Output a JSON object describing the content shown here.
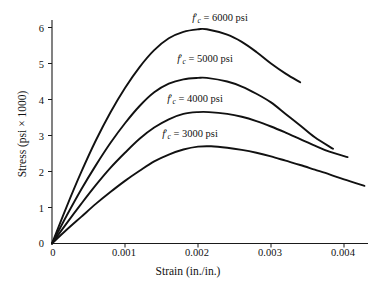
{
  "chart_data": {
    "type": "line",
    "title": "",
    "xlabel": "Strain (in./in.)",
    "ylabel": "Stress (psi × 1000)",
    "xlim": [
      0,
      0.00442
    ],
    "ylim": [
      0,
      6.35
    ],
    "grid": false,
    "legend_position": "inline-on-curves",
    "xticks": [
      "0",
      "0.001",
      "0.002",
      "0.003",
      "0.004"
    ],
    "xtick_values": [
      0,
      0.001,
      0.002,
      0.003,
      0.004
    ],
    "yticks": [
      "0",
      "1",
      "2",
      "3",
      "4",
      "5",
      "6"
    ],
    "ytick_values": [
      0,
      1,
      2,
      3,
      4,
      5,
      6
    ],
    "series": [
      {
        "name": "f'c = 6000 psi",
        "label_parts": {
          "f": "f",
          "prime": "′",
          "sub": "c",
          "rest": " = 6000 psi"
        },
        "peak_strain": 0.00212,
        "peak_stress": 5.95,
        "end_strain": 0.0034,
        "end_stress": 4.48,
        "x": [
          0,
          0.0002,
          0.0004,
          0.0006,
          0.0008,
          0.001,
          0.0012,
          0.0014,
          0.0016,
          0.0018,
          0.002,
          0.00212,
          0.0024,
          0.0026,
          0.0028,
          0.003,
          0.0032,
          0.0034
        ],
        "y": [
          0,
          1.02,
          1.98,
          2.86,
          3.64,
          4.32,
          4.9,
          5.37,
          5.7,
          5.88,
          5.95,
          5.95,
          5.8,
          5.6,
          5.32,
          5.0,
          4.72,
          4.48
        ]
      },
      {
        "name": "f'c = 5000 psi",
        "label_parts": {
          "f": "f",
          "prime": "′",
          "sub": "c",
          "rest": " = 5000 psi"
        },
        "peak_strain": 0.00212,
        "peak_stress": 4.6,
        "end_strain": 0.00385,
        "end_stress": 2.63,
        "x": [
          0,
          0.0002,
          0.0004,
          0.0006,
          0.0008,
          0.001,
          0.0012,
          0.0014,
          0.0016,
          0.0018,
          0.002,
          0.00212,
          0.0024,
          0.0026,
          0.0028,
          0.003,
          0.0032,
          0.0034,
          0.0036,
          0.00385
        ],
        "y": [
          0,
          0.77,
          1.5,
          2.17,
          2.79,
          3.34,
          3.82,
          4.2,
          4.44,
          4.56,
          4.6,
          4.6,
          4.5,
          4.36,
          4.16,
          3.92,
          3.6,
          3.28,
          2.95,
          2.63
        ]
      },
      {
        "name": "f'c = 4000 psi",
        "label_parts": {
          "f": "f",
          "prime": "′",
          "sub": "c",
          "rest": " = 4000 psi"
        },
        "peak_strain": 0.00215,
        "peak_stress": 3.65,
        "end_strain": 0.00405,
        "end_stress": 2.4,
        "x": [
          0,
          0.0002,
          0.0004,
          0.0006,
          0.0008,
          0.001,
          0.0012,
          0.0014,
          0.0016,
          0.0018,
          0.002,
          0.00215,
          0.0024,
          0.0026,
          0.0028,
          0.003,
          0.0032,
          0.0034,
          0.0036,
          0.0038,
          0.00405
        ],
        "y": [
          0,
          0.56,
          1.1,
          1.62,
          2.1,
          2.52,
          2.91,
          3.22,
          3.45,
          3.6,
          3.65,
          3.65,
          3.6,
          3.52,
          3.4,
          3.25,
          3.08,
          2.9,
          2.72,
          2.55,
          2.4
        ]
      },
      {
        "name": "f'c = 3000 psi",
        "label_parts": {
          "f": "f",
          "prime": "′",
          "sub": "c",
          "rest": " = 3000 psi"
        },
        "peak_strain": 0.00218,
        "peak_stress": 2.7,
        "end_strain": 0.00428,
        "end_stress": 1.6,
        "x": [
          0,
          0.0002,
          0.0004,
          0.0006,
          0.0008,
          0.001,
          0.0012,
          0.0014,
          0.0016,
          0.0018,
          0.002,
          0.00218,
          0.0024,
          0.0026,
          0.0028,
          0.003,
          0.0032,
          0.0034,
          0.0036,
          0.0038,
          0.004,
          0.00428
        ],
        "y": [
          0,
          0.38,
          0.74,
          1.1,
          1.43,
          1.74,
          2.02,
          2.28,
          2.47,
          2.61,
          2.69,
          2.7,
          2.66,
          2.6,
          2.52,
          2.42,
          2.3,
          2.18,
          2.05,
          1.92,
          1.78,
          1.6
        ]
      }
    ]
  },
  "labels": {
    "s6000": {
      "f": "f",
      "prime": "′",
      "sub": "c",
      "rest": " = 6000 psi"
    },
    "s5000": {
      "f": "f",
      "prime": "′",
      "sub": "c",
      "rest": " = 5000 psi"
    },
    "s4000": {
      "f": "f",
      "prime": "′",
      "sub": "c",
      "rest": " = 4000 psi"
    },
    "s3000": {
      "f": "f",
      "prime": "′",
      "sub": "c",
      "rest": " = 3000 psi"
    }
  },
  "axes": {
    "x_title": "Strain (in./in.)",
    "y_title": "Stress (psi × 1000)",
    "x_tick_labels": [
      "0",
      "0.001",
      "0.002",
      "0.003",
      "0.004"
    ],
    "y_tick_labels": [
      "0",
      "1",
      "2",
      "3",
      "4",
      "5",
      "6"
    ],
    "x_origin_label": "0"
  },
  "style": {
    "axis_color": "#1a1a1a",
    "curve_color": "#111111",
    "background": "#ffffff"
  }
}
